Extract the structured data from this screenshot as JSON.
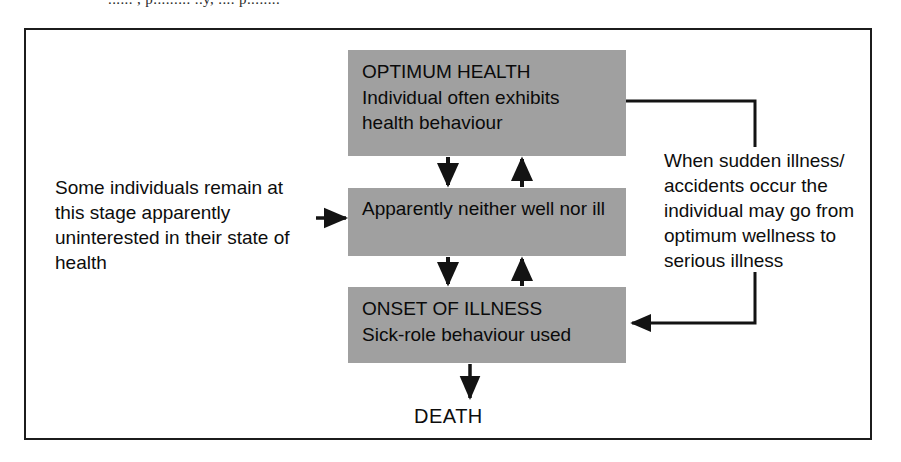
{
  "page": {
    "top_cut_text": "...... , p......... ..y, .... p........",
    "death_label": "DEATH"
  },
  "diagram": {
    "type": "flowchart",
    "orientation": "vertical",
    "box_fill_color": "#a0a0a0",
    "border_color": "#1c1c1c",
    "text_color": "#0d0d0d",
    "nodes": [
      {
        "id": "optimum",
        "title": "OPTIMUM HEALTH",
        "body": "Individual often exhibits health behaviour"
      },
      {
        "id": "neither",
        "title": "",
        "body": "Apparently neither well nor ill"
      },
      {
        "id": "onset",
        "title": "ONSET OF ILLNESS",
        "body": "Sick-role behaviour used"
      }
    ],
    "annotations": [
      {
        "id": "left-note",
        "text": "Some individuals remain at this stage apparently uninterested in their state of health"
      },
      {
        "id": "right-note",
        "text": "When sudden illness/ accidents occur the individual may go from optimum wellness to serious illness"
      }
    ],
    "terminal": "DEATH",
    "connectors": [
      {
        "id": "optimum-to-neither",
        "from": "optimum",
        "to": "neither",
        "direction": "down"
      },
      {
        "id": "neither-to-optimum",
        "from": "neither",
        "to": "optimum",
        "direction": "up"
      },
      {
        "id": "neither-to-onset",
        "from": "neither",
        "to": "onset",
        "direction": "down"
      },
      {
        "id": "onset-to-neither",
        "from": "onset",
        "to": "neither",
        "direction": "up"
      },
      {
        "id": "left-note-to-neither",
        "from": "left-note",
        "to": "neither",
        "direction": "right"
      },
      {
        "id": "optimum-to-onset-bypass",
        "from": "optimum",
        "to": "onset",
        "direction": "right-down-left"
      },
      {
        "id": "onset-to-death",
        "from": "onset",
        "to": "DEATH",
        "direction": "down"
      }
    ]
  }
}
